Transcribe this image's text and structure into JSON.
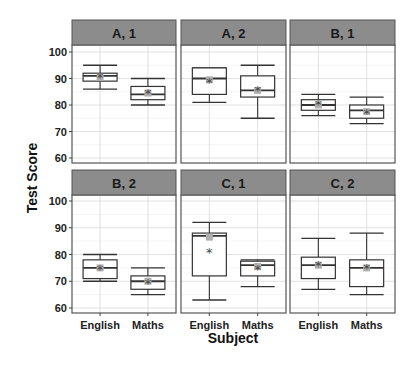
{
  "chart_data": {
    "type": "box",
    "title": "",
    "xlabel": "Subject",
    "ylabel": "Test Score",
    "ylim": [
      58,
      102
    ],
    "yticks": [
      60,
      70,
      80,
      90,
      100
    ],
    "categories": [
      "English",
      "Maths"
    ],
    "grid": true,
    "facets": [
      {
        "label": "A, 1",
        "row": 0,
        "col": 0,
        "boxes": [
          {
            "category": "English",
            "whisker_low": 86,
            "q1": 89,
            "median": 91,
            "q3": 92,
            "whisker_high": 95,
            "mean": 90.5,
            "star": 90.5
          },
          {
            "category": "Maths",
            "whisker_low": 80,
            "q1": 82,
            "median": 84,
            "q3": 87,
            "whisker_high": 90,
            "mean": 84.5,
            "star": 84.5
          }
        ]
      },
      {
        "label": "A, 2",
        "row": 0,
        "col": 1,
        "boxes": [
          {
            "category": "English",
            "whisker_low": 81,
            "q1": 84,
            "median": 90,
            "q3": 94,
            "whisker_high": 94,
            "mean": 89.5,
            "star": 88.5
          },
          {
            "category": "Maths",
            "whisker_low": 75,
            "q1": 83,
            "median": 85.5,
            "q3": 91,
            "whisker_high": 95,
            "mean": 85.5,
            "star": 85.5
          }
        ]
      },
      {
        "label": "B, 1",
        "row": 0,
        "col": 2,
        "boxes": [
          {
            "category": "English",
            "whisker_low": 76,
            "q1": 78,
            "median": 80,
            "q3": 82,
            "whisker_high": 84,
            "mean": 80,
            "star": 80.5
          },
          {
            "category": "Maths",
            "whisker_low": 73,
            "q1": 75,
            "median": 78,
            "q3": 80,
            "whisker_high": 83,
            "mean": 77.5,
            "star": 77
          }
        ]
      },
      {
        "label": "B, 2",
        "row": 1,
        "col": 0,
        "boxes": [
          {
            "category": "English",
            "whisker_low": 70,
            "q1": 71,
            "median": 75,
            "q3": 78,
            "whisker_high": 80,
            "mean": 75,
            "star": 74.5
          },
          {
            "category": "Maths",
            "whisker_low": 65,
            "q1": 67,
            "median": 70,
            "q3": 72,
            "whisker_high": 75,
            "mean": 70,
            "star": 69.5
          }
        ]
      },
      {
        "label": "C, 1",
        "row": 1,
        "col": 1,
        "boxes": [
          {
            "category": "English",
            "whisker_low": 63,
            "q1": 72,
            "median": 87,
            "q3": 88,
            "whisker_high": 92,
            "mean": 86.5,
            "star": 81
          },
          {
            "category": "Maths",
            "whisker_low": 68,
            "q1": 72,
            "median": 76,
            "q3": 77.5,
            "whisker_high": 78,
            "mean": 75.5,
            "star": 74.5
          }
        ]
      },
      {
        "label": "C, 2",
        "row": 1,
        "col": 2,
        "boxes": [
          {
            "category": "English",
            "whisker_low": 67,
            "q1": 71,
            "median": 76,
            "q3": 79,
            "whisker_high": 86,
            "mean": 76,
            "star": 76
          },
          {
            "category": "Maths",
            "whisker_low": 65,
            "q1": 68,
            "median": 75,
            "q3": 78,
            "whisker_high": 88,
            "mean": 75,
            "star": 75
          }
        ]
      }
    ]
  },
  "colors": {
    "strip_fill": "#8c8c8c",
    "panel_border": "#555555",
    "grid_major": "#d9d9d9",
    "grid_minor": "#eeeeee",
    "box_line": "#333333",
    "mean_marker": "#b0b0b0",
    "star_marker": "#444444"
  }
}
